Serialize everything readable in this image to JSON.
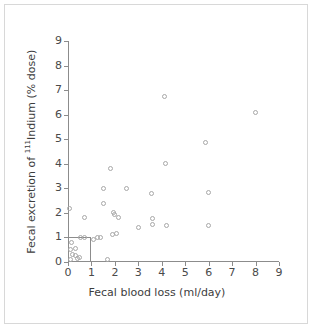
{
  "chart_data": {
    "type": "scatter",
    "title": "",
    "xlabel": "Fecal blood loss (ml/day)",
    "ylabel_prefix": "Fecal excretion of ",
    "ylabel_superscript": "111",
    "ylabel_suffix": "Indium (% dose)",
    "ylabel": "Fecal excretion of 111Indium (% dose)",
    "xlim": [
      0,
      9
    ],
    "ylim": [
      0,
      9
    ],
    "xticks": [
      0,
      1,
      2,
      3,
      4,
      5,
      6,
      7,
      8,
      9
    ],
    "yticks": [
      0,
      1,
      2,
      3,
      4,
      5,
      6,
      7,
      8,
      9
    ],
    "grid": false,
    "legend": null,
    "marker": "open-circle",
    "marker_color": "#a8a8a8",
    "axis_color": "#8c8c8c",
    "reference_lines": {
      "description": "upper-limit-of-normal box from origin to (1, 1)",
      "x": 1,
      "y": 1
    },
    "points": [
      {
        "x": 0.08,
        "y": 2.18
      },
      {
        "x": 0.15,
        "y": 0.78
      },
      {
        "x": 0.12,
        "y": 0.52
      },
      {
        "x": 0.18,
        "y": 0.3
      },
      {
        "x": 0.1,
        "y": 0.12
      },
      {
        "x": 0.3,
        "y": 0.55
      },
      {
        "x": 0.32,
        "y": 0.28
      },
      {
        "x": 0.42,
        "y": 0.15
      },
      {
        "x": 0.5,
        "y": 0.2
      },
      {
        "x": 0.55,
        "y": 0.98
      },
      {
        "x": 0.7,
        "y": 1.8
      },
      {
        "x": 0.72,
        "y": 0.98
      },
      {
        "x": 1.1,
        "y": 0.92
      },
      {
        "x": 1.25,
        "y": 1.0
      },
      {
        "x": 1.4,
        "y": 1.0
      },
      {
        "x": 1.5,
        "y": 2.98
      },
      {
        "x": 1.52,
        "y": 2.4
      },
      {
        "x": 1.68,
        "y": 0.12
      },
      {
        "x": 1.82,
        "y": 3.82
      },
      {
        "x": 1.88,
        "y": 1.1
      },
      {
        "x": 1.95,
        "y": 2.02
      },
      {
        "x": 2.0,
        "y": 1.92
      },
      {
        "x": 2.05,
        "y": 1.18
      },
      {
        "x": 2.15,
        "y": 1.8
      },
      {
        "x": 2.5,
        "y": 3.0
      },
      {
        "x": 3.0,
        "y": 1.42
      },
      {
        "x": 3.55,
        "y": 2.8
      },
      {
        "x": 3.6,
        "y": 1.78
      },
      {
        "x": 3.62,
        "y": 1.52
      },
      {
        "x": 4.1,
        "y": 6.72
      },
      {
        "x": 4.15,
        "y": 4.02
      },
      {
        "x": 4.2,
        "y": 1.5
      },
      {
        "x": 5.85,
        "y": 4.85
      },
      {
        "x": 6.0,
        "y": 2.82
      },
      {
        "x": 6.0,
        "y": 1.5
      },
      {
        "x": 8.0,
        "y": 6.08
      }
    ]
  }
}
